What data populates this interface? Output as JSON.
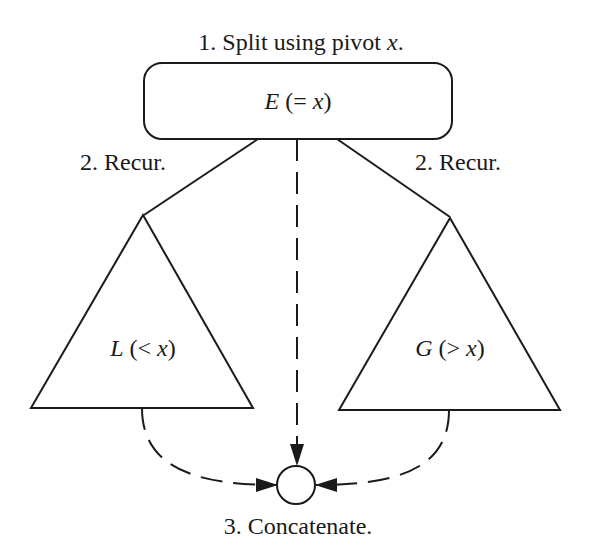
{
  "diagram": {
    "title_step": {
      "prefix": "1. Split using pivot ",
      "var": "x",
      "suffix": "."
    },
    "pivot_node": {
      "name": "E",
      "open": " (= ",
      "var": "x",
      "close": ")"
    },
    "left_edge_label": "2. Recur.",
    "right_edge_label": "2. Recur.",
    "left_subtree": {
      "name": "L",
      "open": " (< ",
      "var": "x",
      "close": ")"
    },
    "right_subtree": {
      "name": "G",
      "open": " (> ",
      "var": "x",
      "close": ")"
    },
    "concat_label": "3. Concatenate.",
    "colors": {
      "stroke": "#1a1a1a",
      "background": "#ffffff"
    }
  }
}
